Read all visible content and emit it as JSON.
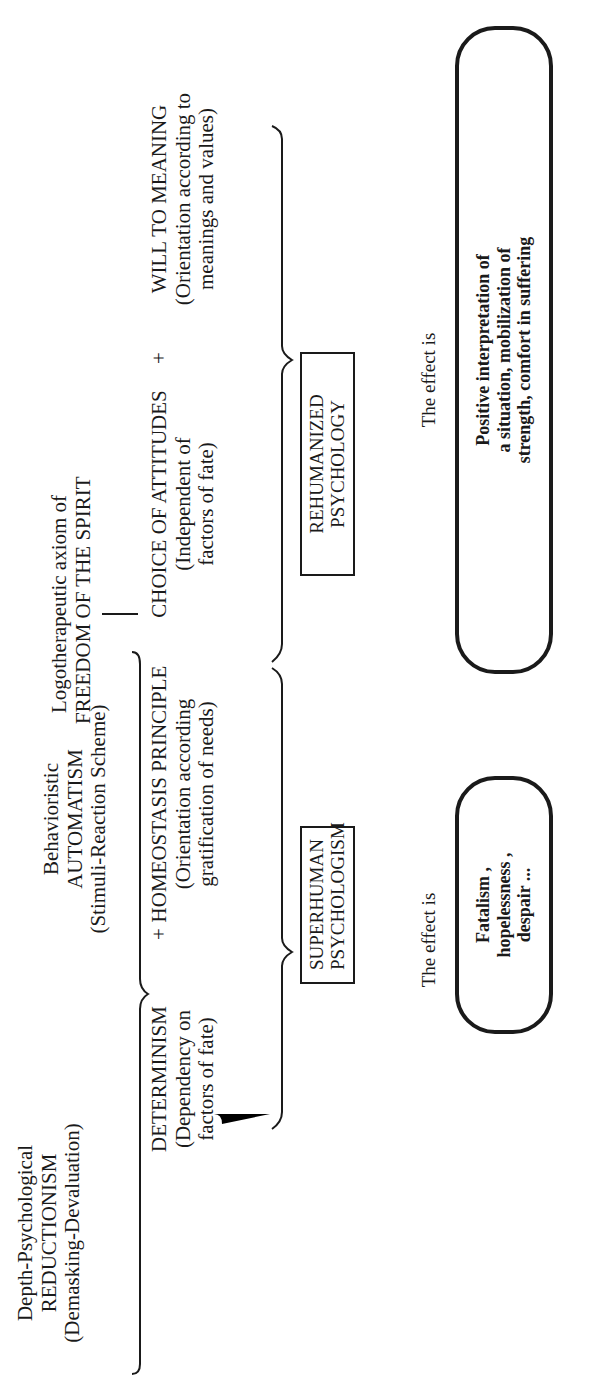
{
  "diagram": {
    "orientation": "rotated 90deg counter-clockwise",
    "sources": [
      {
        "id": "reductionism",
        "lines": [
          "Depth-Psychological",
          "REDUCTIONISM",
          "(Demasking-Devaluation)"
        ]
      },
      {
        "id": "automatism",
        "lines": [
          "Behavioristic",
          "AUTOMATISM",
          "(Stimuli-Reaction Scheme)"
        ]
      },
      {
        "id": "freedom",
        "lines": [
          "Logotherapeutic axiom of",
          "FREEDOM OF THE SPIRIT"
        ]
      }
    ],
    "concepts": {
      "determinism": {
        "title": "DETERMINISM",
        "desc": [
          "(Dependency on",
          "factors of fate)"
        ]
      },
      "plus_1": "+",
      "homeostasis": {
        "title": "HOMEOSTASIS PRINCIPLE",
        "desc": [
          "(Orientation according",
          "gratification of needs)"
        ]
      },
      "choice": {
        "title": "CHOICE OF ATTITUDES",
        "desc": [
          "(Independent of",
          "factors of fate)"
        ]
      },
      "plus_2": "+",
      "will": {
        "title": "WILL TO MEANING",
        "desc": [
          "(Orientation according to",
          "meanings and values)"
        ]
      }
    },
    "results": {
      "left": {
        "lines": [
          "SUPERHUMAN",
          "PSYCHOLOGISM"
        ]
      },
      "right": {
        "lines": [
          "REHUMANIZED",
          "PSYCHOLOGY"
        ]
      }
    },
    "effects": {
      "left": {
        "label": "The effect is",
        "lines": [
          "Fatalism ,",
          "hopelessness ,",
          "despair ..."
        ]
      },
      "right": {
        "label": "The effect is",
        "lines": [
          "Positive interpretation of",
          "a situation, mobilization of",
          "strength, comfort in suffering"
        ]
      }
    }
  }
}
